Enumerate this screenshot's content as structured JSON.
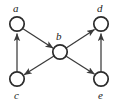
{
  "figure": {
    "type": "directed-graph",
    "background_color": "#ffffff",
    "stroke_color": "#3a3a3a",
    "node_fill_color": "#ffffff",
    "label_color": "#1a1a1a",
    "width": 118,
    "height": 106
  },
  "nodes": [
    {
      "id": "a",
      "label": "a",
      "cx": 17,
      "cy": 24,
      "r": 7.5,
      "label_x": 13,
      "label_y": 3
    },
    {
      "id": "b",
      "label": "b",
      "cx": 60,
      "cy": 52,
      "r": 7.5,
      "label_x": 56,
      "label_y": 31
    },
    {
      "id": "c",
      "label": "c",
      "cx": 17,
      "cy": 79,
      "r": 7.5,
      "label_x": 14,
      "label_y": 90
    },
    {
      "id": "d",
      "label": "d",
      "cx": 101,
      "cy": 24,
      "r": 7.5,
      "label_x": 97,
      "label_y": 3
    },
    {
      "id": "e",
      "label": "e",
      "cx": 101,
      "cy": 79,
      "r": 7.5,
      "label_x": 98,
      "label_y": 90
    }
  ],
  "edges": [
    {
      "id": "c-to-a",
      "from": "c",
      "to": "a",
      "directed": true
    },
    {
      "id": "a-to-b",
      "from": "a",
      "to": "b",
      "directed": true
    },
    {
      "id": "b-to-c",
      "from": "b",
      "to": "c",
      "directed": true
    },
    {
      "id": "b-to-d",
      "from": "b",
      "to": "d",
      "directed": true
    },
    {
      "id": "b-to-e",
      "from": "b",
      "to": "e",
      "directed": true
    },
    {
      "id": "e-to-d",
      "from": "e",
      "to": "d",
      "directed": true
    }
  ]
}
